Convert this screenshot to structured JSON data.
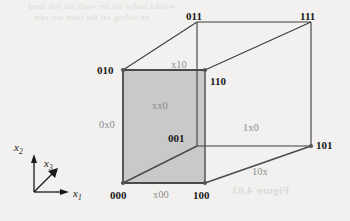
{
  "figure": {
    "type": "boolean-cube-diagram",
    "background_color": "#f2f1ef",
    "line_color": "#3c3c3c",
    "shaded_face_color": "#c9c9c9",
    "vertex_dot_color": "#555555",
    "vertex_label_color": "#1a1a1a",
    "edge_label_color": "#8c8c8c"
  },
  "vertices": {
    "v000": {
      "label": "000",
      "x": 123,
      "y": 183
    },
    "v100": {
      "label": "100",
      "x": 205,
      "y": 183
    },
    "v010": {
      "label": "010",
      "x": 123,
      "y": 70
    },
    "v110": {
      "label": "110",
      "x": 205,
      "y": 70
    },
    "v001": {
      "label": "001",
      "x": 197,
      "y": 146
    },
    "v101": {
      "label": "101",
      "x": 311,
      "y": 146
    },
    "v011": {
      "label": "011",
      "x": 197,
      "y": 22
    },
    "v111": {
      "label": "111",
      "x": 311,
      "y": 22
    }
  },
  "edge_labels": {
    "x00": "x00",
    "zero_x_zero": "0x0",
    "x10": "x10",
    "one_x_zero": "1x0",
    "ten_x": "10x"
  },
  "face_labels": {
    "xx0": "xx0"
  },
  "axes": {
    "x1": {
      "name": "x",
      "sub": "1"
    },
    "x2": {
      "name": "x",
      "sub": "2"
    },
    "x3": {
      "name": "x",
      "sub": "3"
    }
  },
  "background_text": {
    "bleed_line_1": "wonka hadve bit the wath tab not dand",
    "bleed_line_2": "ne ouling sat the lowe ant sale",
    "bleed_figure_caption": "Figure 4.03"
  }
}
